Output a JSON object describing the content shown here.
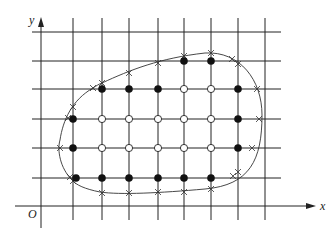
{
  "diagram": {
    "type": "grid-boundary-nodes",
    "axes": {
      "x_label": "x",
      "y_label": "y",
      "origin_label": "O"
    },
    "grid": {
      "columns_x": [
        73,
        102,
        129,
        158,
        184,
        211,
        238,
        265
      ],
      "rows_y": [
        32,
        61,
        89,
        119,
        148,
        178
      ],
      "x_range": [
        32,
        281
      ],
      "y_range": [
        18,
        220
      ]
    },
    "legend_meaning": {
      "filled": "boundary-adjacent inner node",
      "hollow": "interior node",
      "cross": "intersection of boundary curve with grid lines"
    },
    "filled_nodes": [
      [
        184,
        61
      ],
      [
        211,
        61
      ],
      [
        102,
        89
      ],
      [
        129,
        89
      ],
      [
        158,
        89
      ],
      [
        238,
        89
      ],
      [
        73,
        119
      ],
      [
        238,
        119
      ],
      [
        73,
        148
      ],
      [
        238,
        148
      ],
      [
        76,
        178
      ],
      [
        102,
        178
      ],
      [
        129,
        178
      ],
      [
        158,
        178
      ],
      [
        184,
        178
      ],
      [
        211,
        178
      ]
    ],
    "hollow_nodes": [
      [
        184,
        89
      ],
      [
        211,
        89
      ],
      [
        102,
        119
      ],
      [
        129,
        119
      ],
      [
        158,
        119
      ],
      [
        184,
        119
      ],
      [
        211,
        119
      ],
      [
        102,
        148
      ],
      [
        129,
        148
      ],
      [
        158,
        148
      ],
      [
        184,
        148
      ],
      [
        211,
        148
      ]
    ],
    "cross_points": [
      [
        93,
        88
      ],
      [
        102,
        83
      ],
      [
        129,
        73
      ],
      [
        158,
        63
      ],
      [
        184,
        56
      ],
      [
        211,
        53
      ],
      [
        232,
        59
      ],
      [
        238,
        64
      ],
      [
        257,
        89
      ],
      [
        259,
        119
      ],
      [
        252,
        148
      ],
      [
        238,
        172
      ],
      [
        233,
        176
      ],
      [
        211,
        189
      ],
      [
        184,
        192
      ],
      [
        158,
        192
      ],
      [
        129,
        193
      ],
      [
        102,
        193
      ],
      [
        73,
        181
      ],
      [
        70,
        177
      ],
      [
        60,
        148
      ],
      [
        68,
        118
      ],
      [
        73,
        107
      ]
    ],
    "curve_path": "M 102 83 C 130 70, 160 58, 205 53 C 240 51, 262 80, 262 115 C 262 160, 250 185, 205 189 C 160 193, 120 195, 100 192 C 85 189, 76 185, 72 180 C 60 168, 57 150, 60 140 C 63 120, 72 100, 93 88 C 96 86, 99 84, 102 83 Z"
  }
}
